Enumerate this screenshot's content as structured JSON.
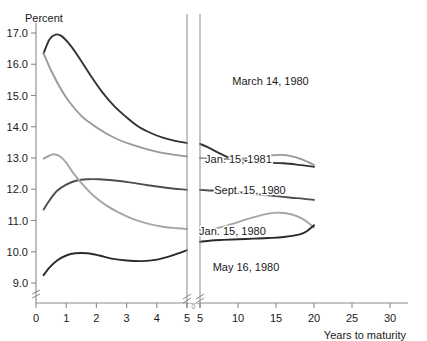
{
  "chart_data": {
    "type": "line",
    "title": "",
    "subtitle": "",
    "ylabel": "Percent",
    "xlabel": "Years to maturity",
    "ylim": [
      8.3,
      17.6
    ],
    "ytick_labels": [
      "9.0",
      "10.0",
      "11.0",
      "12.0",
      "13.0",
      "14.0",
      "15.0",
      "16.0",
      "17.0"
    ],
    "ytick_values": [
      9.0,
      10.0,
      11.0,
      12.0,
      13.0,
      14.0,
      15.0,
      16.0,
      17.0
    ],
    "xtick_labels_left": [
      "0",
      "1",
      "2",
      "3",
      "4",
      "5"
    ],
    "xtick_values_left": [
      0,
      1,
      2,
      3,
      4,
      5
    ],
    "xtick_labels_right": [
      "5",
      "10",
      "15",
      "20",
      "25",
      "30"
    ],
    "xtick_values_right": [
      5,
      10,
      15,
      20,
      25,
      30
    ],
    "grid": false,
    "legend": "inline-curve-labels",
    "axis_break": {
      "axis": "x",
      "at": 5,
      "style": "double-vertical-rule-with-slash-ticks"
    },
    "series": [
      {
        "name": "March 14, 1980",
        "color": "#333333",
        "label_x": 6.5,
        "label_y": 15.35,
        "points_left": [
          [
            0.25,
            16.35
          ],
          [
            0.45,
            16.8
          ],
          [
            0.65,
            16.95
          ],
          [
            0.85,
            16.9
          ],
          [
            1.1,
            16.65
          ],
          [
            1.4,
            16.25
          ],
          [
            1.8,
            15.65
          ],
          [
            2.2,
            15.1
          ],
          [
            2.6,
            14.65
          ],
          [
            3.0,
            14.3
          ],
          [
            3.4,
            14.0
          ],
          [
            3.8,
            13.8
          ],
          [
            4.2,
            13.65
          ],
          [
            4.6,
            13.55
          ],
          [
            5.0,
            13.48
          ]
        ],
        "points_right": [
          [
            5.0,
            13.45
          ],
          [
            6.0,
            13.35
          ],
          [
            7.0,
            13.22
          ],
          [
            8.0,
            13.1
          ],
          [
            9.0,
            13.0
          ],
          [
            10.0,
            12.95
          ],
          [
            12.0,
            12.87
          ],
          [
            14.0,
            12.85
          ],
          [
            16.0,
            12.83
          ],
          [
            18.0,
            12.78
          ],
          [
            20.0,
            12.72
          ]
        ]
      },
      {
        "name": "Jan. 15, 1981",
        "color": "#999999",
        "label_x": 5.6,
        "label_y": 12.85,
        "points_left": [
          [
            0.25,
            16.35
          ],
          [
            0.5,
            15.8
          ],
          [
            0.8,
            15.25
          ],
          [
            1.1,
            14.8
          ],
          [
            1.5,
            14.35
          ],
          [
            1.9,
            14.05
          ],
          [
            2.3,
            13.8
          ],
          [
            2.7,
            13.6
          ],
          [
            3.1,
            13.45
          ],
          [
            3.6,
            13.3
          ],
          [
            4.1,
            13.18
          ],
          [
            4.6,
            13.1
          ],
          [
            5.0,
            13.05
          ]
        ],
        "points_right": [
          [
            5.0,
            13.0
          ],
          [
            6.5,
            12.98
          ],
          [
            8.0,
            12.97
          ],
          [
            10.0,
            12.97
          ],
          [
            12.0,
            13.02
          ],
          [
            14.0,
            13.07
          ],
          [
            15.5,
            13.1
          ],
          [
            17.0,
            13.06
          ],
          [
            18.5,
            12.95
          ],
          [
            20.0,
            12.78
          ]
        ]
      },
      {
        "name": "Sept. 15, 1980",
        "color": "#4d4d4d",
        "label_x": 5.9,
        "label_y": 11.85,
        "points_left": [
          [
            0.25,
            11.35
          ],
          [
            0.45,
            11.65
          ],
          [
            0.7,
            11.95
          ],
          [
            1.0,
            12.15
          ],
          [
            1.35,
            12.28
          ],
          [
            1.7,
            12.32
          ],
          [
            2.1,
            12.32
          ],
          [
            2.6,
            12.28
          ],
          [
            3.1,
            12.22
          ],
          [
            3.7,
            12.13
          ],
          [
            4.3,
            12.05
          ],
          [
            5.0,
            11.98
          ]
        ],
        "points_right": [
          [
            5.0,
            11.98
          ],
          [
            7.0,
            11.95
          ],
          [
            9.0,
            11.92
          ],
          [
            11.0,
            11.88
          ],
          [
            13.0,
            11.83
          ],
          [
            15.0,
            11.78
          ],
          [
            17.0,
            11.73
          ],
          [
            18.5,
            11.7
          ],
          [
            20.0,
            11.66
          ]
        ]
      },
      {
        "name": "Jan. 15, 1980",
        "color": "#a6a6a6",
        "label_x": 5.4,
        "label_y": 10.55,
        "points_left": [
          [
            0.25,
            12.98
          ],
          [
            0.45,
            13.08
          ],
          [
            0.6,
            13.12
          ],
          [
            0.8,
            13.05
          ],
          [
            1.0,
            12.85
          ],
          [
            1.25,
            12.5
          ],
          [
            1.55,
            12.15
          ],
          [
            1.9,
            11.8
          ],
          [
            2.3,
            11.5
          ],
          [
            2.75,
            11.25
          ],
          [
            3.2,
            11.05
          ],
          [
            3.7,
            10.9
          ],
          [
            4.2,
            10.8
          ],
          [
            4.7,
            10.75
          ],
          [
            5.0,
            10.73
          ]
        ],
        "points_right": [
          [
            5.0,
            10.7
          ],
          [
            6.5,
            10.72
          ],
          [
            8.0,
            10.8
          ],
          [
            10.0,
            10.95
          ],
          [
            12.0,
            11.1
          ],
          [
            14.0,
            11.22
          ],
          [
            15.5,
            11.25
          ],
          [
            17.0,
            11.2
          ],
          [
            18.5,
            11.05
          ],
          [
            20.0,
            10.78
          ]
        ]
      },
      {
        "name": "May 16, 1980",
        "color": "#2b2b2b",
        "label_x": 5.85,
        "label_y": 9.4,
        "points_left": [
          [
            0.25,
            9.25
          ],
          [
            0.45,
            9.5
          ],
          [
            0.7,
            9.72
          ],
          [
            1.0,
            9.88
          ],
          [
            1.3,
            9.95
          ],
          [
            1.7,
            9.95
          ],
          [
            2.1,
            9.88
          ],
          [
            2.5,
            9.78
          ],
          [
            3.0,
            9.72
          ],
          [
            3.5,
            9.7
          ],
          [
            4.0,
            9.75
          ],
          [
            4.5,
            9.88
          ],
          [
            5.0,
            10.05
          ]
        ],
        "points_right": [
          [
            5.0,
            10.32
          ],
          [
            6.5,
            10.36
          ],
          [
            8.0,
            10.38
          ],
          [
            10.0,
            10.4
          ],
          [
            12.0,
            10.42
          ],
          [
            14.0,
            10.44
          ],
          [
            16.0,
            10.47
          ],
          [
            18.0,
            10.55
          ],
          [
            19.0,
            10.65
          ],
          [
            20.0,
            10.85
          ]
        ]
      }
    ]
  },
  "axes": {
    "y_axis_break_symbol": "break",
    "x_axis_break_symbol": "break"
  }
}
